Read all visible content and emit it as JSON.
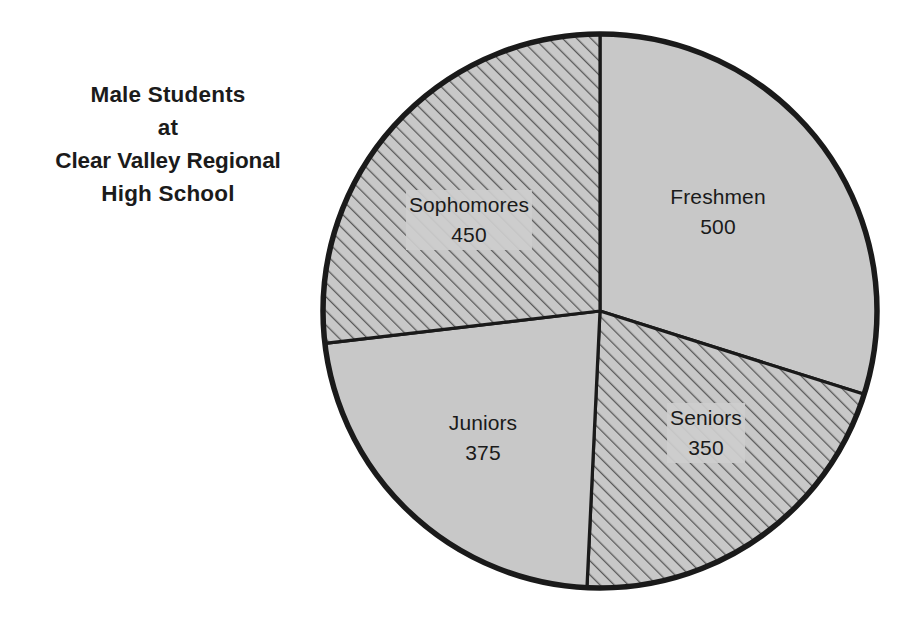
{
  "title": {
    "lines": [
      "Male Students",
      "at",
      "Clear Valley Regional",
      "High School"
    ]
  },
  "colors": {
    "background": "#ffffff",
    "slice_fill": "#c8c8c8",
    "outline": "#1a1a1a",
    "hatch_line": "#595959",
    "text": "#1a1a1a"
  },
  "chart_data": {
    "type": "pie",
    "title": "Male Students at Clear Valley Regional High School",
    "xlabel": "",
    "ylabel": "",
    "total": 1675,
    "start_angle_deg": 0,
    "direction": "clockwise",
    "legend": "none",
    "grid": false,
    "categories": [
      "Freshmen",
      "Seniors",
      "Juniors",
      "Sophomores"
    ],
    "values": [
      500,
      350,
      375,
      450
    ],
    "slices": [
      {
        "label": "Freshmen",
        "value": 500,
        "value_text": "500",
        "angle_deg": 107.5,
        "percent": 29.9,
        "fill": "solid-gray",
        "start_deg": 0,
        "end_deg": 107.5,
        "label_x": 718,
        "label_y": 212
      },
      {
        "label": "Seniors",
        "value": 350,
        "value_text": "350",
        "angle_deg": 75.2,
        "percent": 20.9,
        "fill": "hatched",
        "start_deg": 107.5,
        "end_deg": 182.7,
        "label_x": 706,
        "label_y": 433
      },
      {
        "label": "Juniors",
        "value": 375,
        "value_text": "375",
        "angle_deg": 80.6,
        "percent": 22.4,
        "fill": "solid-gray",
        "start_deg": 182.7,
        "end_deg": 263.3,
        "label_x": 483,
        "label_y": 438
      },
      {
        "label": "Sophomores",
        "value": 450,
        "value_text": "450",
        "angle_deg": 96.7,
        "percent": 26.9,
        "fill": "hatched",
        "start_deg": 263.3,
        "end_deg": 360,
        "label_x": 469,
        "label_y": 220
      }
    ]
  }
}
